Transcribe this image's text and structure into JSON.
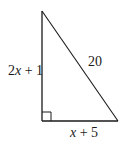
{
  "figure": {
    "type": "right-triangle",
    "stroke_color": "#1a1a1a",
    "vertices": {
      "top": [
        42,
        11
      ],
      "right_angle": [
        42,
        121
      ],
      "bottom_right": [
        118,
        121
      ]
    },
    "right_angle_marker": {
      "corner": "bottom-left",
      "size": 9
    },
    "labels": {
      "left_leg": {
        "coef": "2",
        "var": "x",
        "rest": " + 1",
        "full": "2x + 1"
      },
      "hypotenuse": {
        "full": "20"
      },
      "bottom_leg": {
        "var": "x",
        "rest": " + 5",
        "full": "x + 5"
      }
    }
  }
}
